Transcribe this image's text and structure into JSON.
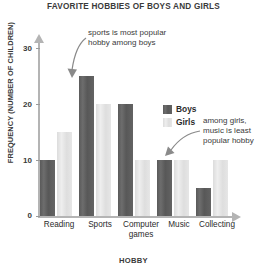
{
  "chart_data": {
    "type": "bar",
    "title": "FAVORITE HOBBIES OF BOYS AND GIRLS",
    "xlabel": "HOBBY",
    "ylabel": "FREQUENCY (NUMBER OF CHILDREN)",
    "categories": [
      "Reading",
      "Sports",
      "Computer games",
      "Music",
      "Collecting"
    ],
    "series": [
      {
        "name": "Boys",
        "values": [
          10,
          25,
          20,
          10,
          5
        ],
        "color": "#5e5e5e"
      },
      {
        "name": "Girls",
        "values": [
          15,
          20,
          10,
          10,
          10
        ],
        "color": "#e2e2e2"
      }
    ],
    "ylim": [
      0,
      32
    ],
    "yticks": [
      0,
      10,
      20,
      30
    ],
    "ytick_labels": [
      "0",
      "10",
      "20",
      "30"
    ],
    "grid": false,
    "legend_position": "inside-right",
    "annotations": [
      {
        "id": "annotation-sports",
        "text": "sports is most popular hobby among boys",
        "target": "Sports / Boys"
      },
      {
        "id": "annotation-music",
        "text": "among girls, music is least popular hobby",
        "target": "Music / Girls"
      }
    ]
  },
  "legend": {
    "items": [
      {
        "label": "Boys",
        "color": "#5e5e5e"
      },
      {
        "label": "Girls",
        "color": "#e2e2e2"
      }
    ]
  },
  "annotations": {
    "top": "sports is most popular hobby among boys",
    "right": "among girls, music is least popular hobby"
  },
  "axes": {
    "y_tick_0": "0",
    "y_tick_10": "10",
    "y_tick_20": "20",
    "y_tick_30": "30"
  }
}
